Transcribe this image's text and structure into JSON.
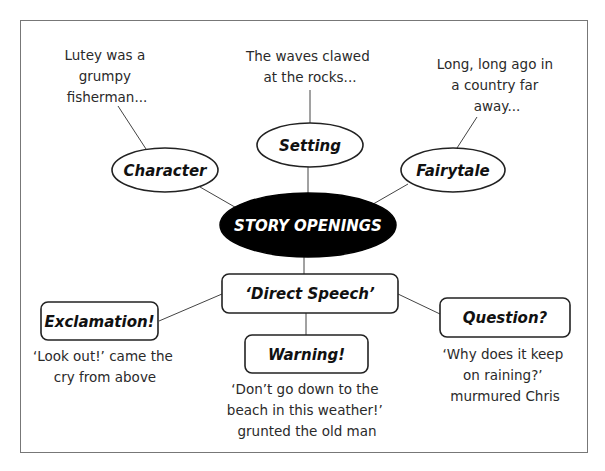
{
  "diagram": {
    "center": {
      "label": "STORY OPENINGS",
      "fill": "#000000"
    },
    "nodes": [
      {
        "id": "character",
        "label": "Character",
        "shape": "ellipse",
        "example": [
          "Lutey was a",
          "grumpy",
          "fisherman..."
        ]
      },
      {
        "id": "setting",
        "label": "Setting",
        "shape": "ellipse",
        "example": [
          "The waves clawed",
          "at the rocks..."
        ]
      },
      {
        "id": "fairytale",
        "label": "Fairytale",
        "shape": "ellipse",
        "example": [
          "Long, long ago in",
          "a country far",
          "away..."
        ]
      },
      {
        "id": "direct-speech",
        "label": "‘Direct Speech’",
        "shape": "rounded-box",
        "example": []
      },
      {
        "id": "exclamation",
        "label": "Exclamation!",
        "shape": "rounded-box",
        "example": [
          "‘Look out!’ came the",
          "cry from above"
        ]
      },
      {
        "id": "warning",
        "label": "Warning!",
        "shape": "rounded-box",
        "example": [
          "‘Don’t go down to the",
          "beach in this weather!’",
          "grunted the old man"
        ]
      },
      {
        "id": "question",
        "label": "Question?",
        "shape": "rounded-box",
        "example": [
          "‘Why does it keep",
          "on raining?’",
          "murmured Chris"
        ]
      }
    ],
    "edges": [
      [
        "story-openings",
        "character"
      ],
      [
        "story-openings",
        "setting"
      ],
      [
        "story-openings",
        "fairytale"
      ],
      [
        "story-openings",
        "direct-speech"
      ],
      [
        "direct-speech",
        "exclamation"
      ],
      [
        "direct-speech",
        "warning"
      ],
      [
        "direct-speech",
        "question"
      ],
      [
        "character",
        "character-example"
      ],
      [
        "setting",
        "setting-example"
      ],
      [
        "fairytale",
        "fairytale-example"
      ]
    ]
  }
}
